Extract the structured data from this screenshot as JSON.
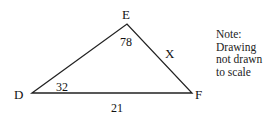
{
  "diagram": {
    "type": "triangle",
    "vertices": {
      "D": {
        "label": "D",
        "x": 32,
        "y": 93
      },
      "E": {
        "label": "E",
        "x": 127,
        "y": 24
      },
      "F": {
        "label": "F",
        "x": 192,
        "y": 93
      }
    },
    "angles": {
      "D": "32",
      "E": "78"
    },
    "sides": {
      "EF": "X",
      "DF": "21"
    },
    "note": {
      "lines": [
        "Note:",
        "Drawing",
        "not drawn",
        "to scale"
      ]
    },
    "stroke_color": "#222222"
  }
}
